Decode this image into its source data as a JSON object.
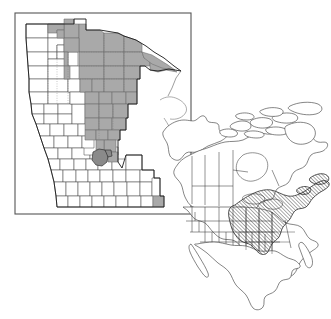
{
  "figure": {
    "type": "map-figure",
    "title": "",
    "caption": "",
    "background_color": "#ffffff",
    "width": 331,
    "height": 319
  },
  "colors": {
    "shaded_county_fill": "#a9a9a9",
    "dark_county_fill": "#8a8a8a",
    "unshaded_county_fill": "#ffffff",
    "county_stroke": "#4d4d4d",
    "state_outline": "#1a1a1a",
    "inset_frame": "#555555",
    "hatch_stroke": "#1f1f1f",
    "continent_stroke": "#3b3b3b"
  },
  "inset_map": {
    "name": "minnesota-county-map",
    "frame": {
      "x": 15,
      "y": 13,
      "width": 176,
      "height": 201
    },
    "shaded_region_label": "",
    "legend_items": [],
    "shaded_county_count": 40,
    "dark_county_count": 2
  },
  "overview_map": {
    "name": "north-america-map",
    "hatched_region_label": "",
    "hatch_angle_degrees": 45,
    "hatch_spacing_px": 2.6
  },
  "annotations": {
    "text_labels": [],
    "scale_bar": "",
    "north_arrow": ""
  }
}
